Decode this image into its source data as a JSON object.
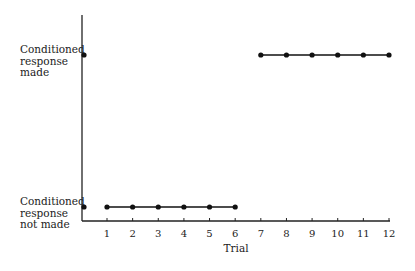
{
  "chart_data": {
    "type": "line",
    "title": "",
    "xlabel": "Trial",
    "ylabel": "",
    "x_ticks": [
      "1",
      "2",
      "3",
      "4",
      "5",
      "6",
      "7",
      "8",
      "9",
      "10",
      "11",
      "12"
    ],
    "y_levels": [
      {
        "value": 0,
        "label_lines": [
          "Conditioned",
          "response",
          "not made"
        ]
      },
      {
        "value": 1,
        "label_lines": [
          "Conditioned",
          "response",
          "made"
        ]
      }
    ],
    "y_axis_markers": [
      0,
      1
    ],
    "series": [
      {
        "name": "trials-1-6",
        "x": [
          1,
          2,
          3,
          4,
          5,
          6
        ],
        "y": [
          0,
          0,
          0,
          0,
          0,
          0
        ]
      },
      {
        "name": "trials-7-12",
        "x": [
          7,
          8,
          9,
          10,
          11,
          12
        ],
        "y": [
          1,
          1,
          1,
          1,
          1,
          1
        ]
      }
    ],
    "xlim": [
      0,
      12
    ],
    "ylim": [
      0,
      1
    ],
    "grid": false,
    "legend": "none"
  }
}
